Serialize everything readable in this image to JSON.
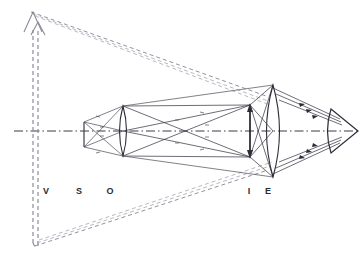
{
  "figure": {
    "background_color": "#ffffff",
    "width": 364,
    "height": 261
  },
  "colors": {
    "axis": "#3a3a46",
    "ray_solid": "#3c3c48",
    "ray_dashed": "#6e6e7a",
    "ray_dashed_faint": "#9a9aa6",
    "lens": "#2c2c38",
    "image_arrow": "#15151c",
    "virtual_arrow": "#8c8c99",
    "label": "#2b2b36"
  },
  "labels": [
    {
      "id": "label-v",
      "text": "V",
      "x": 46,
      "y": 194,
      "meaning": "virtual-image"
    },
    {
      "id": "label-s",
      "text": "S",
      "x": 79,
      "y": 194,
      "meaning": "specimen-object"
    },
    {
      "id": "label-o",
      "text": "O",
      "x": 110,
      "y": 194,
      "meaning": "objective-lens"
    },
    {
      "id": "label-i",
      "text": "I",
      "x": 249,
      "y": 194,
      "meaning": "intermediate-image"
    },
    {
      "id": "label-e",
      "text": "E",
      "x": 268,
      "y": 194,
      "meaning": "eyepiece-lens"
    }
  ],
  "optical_axis": {
    "y": 131,
    "x_start": 14,
    "x_end": 360,
    "style": "dash-dot"
  },
  "elements": {
    "objective_lens": {
      "name": "objective-lens",
      "label": "O",
      "center_x": 123,
      "center_y": 131,
      "semi_height": 25,
      "bulge": 7
    },
    "eyepiece_lens": {
      "name": "eyepiece-lens",
      "label": "E",
      "center_x": 273,
      "center_y": 131,
      "semi_height": 46,
      "bulge": 12
    },
    "eye": {
      "name": "observer-eye",
      "apex_x": 358,
      "back_x": 330,
      "center_y": 131,
      "semi_height": 22
    },
    "object": {
      "name": "specimen-object",
      "label": "S",
      "x": 84,
      "top_y": 122,
      "bottom_y": 147
    },
    "intermediate_image": {
      "name": "intermediate-image-arrow",
      "label": "I",
      "x": 250,
      "top_y": 105,
      "bottom_y": 157
    },
    "virtual_image": {
      "name": "virtual-image-arrow",
      "label": "V",
      "x": 33,
      "tip_y": 12,
      "base_y": 243,
      "second_x": 38
    }
  },
  "ray_bundles": {
    "object_to_objective": "solid rays from specimen tip and base through objective lens",
    "objective_to_image": "solid converging rays forming real inverted intermediate image at I",
    "image_to_eyepiece": "solid rays from intermediate image to eyepiece",
    "eyepiece_to_eye": "parallel solid ray bundles converging into the eye pupil",
    "virtual_extensions": "dashed back-extensions from eyepiece to the enlarged virtual image V"
  }
}
